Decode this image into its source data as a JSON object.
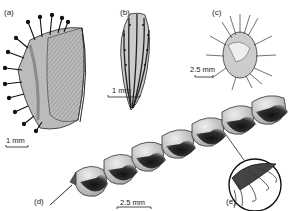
{
  "figure": {
    "panels": [
      {
        "id": "a",
        "label": "(a)",
        "description": "achene with hooked hairs on one face",
        "scale_bar": "1 mm"
      },
      {
        "id": "b",
        "label": "(b)",
        "description": "ribbed tuberculate achene",
        "scale_bar": "1 mm"
      },
      {
        "id": "c",
        "label": "(c)",
        "description": "spiny burr fruit",
        "scale_bar": "2.5 mm"
      },
      {
        "id": "d",
        "label": "(d)",
        "description": "segmented loment pod",
        "scale_bar": "2.5 mm"
      },
      {
        "id": "e",
        "label": "(e)",
        "description": "magnified detail of hooked hairs"
      }
    ],
    "colors": {
      "ink": "#1a1a1a",
      "stipple": "#555555",
      "paper": "#ffffff"
    }
  }
}
